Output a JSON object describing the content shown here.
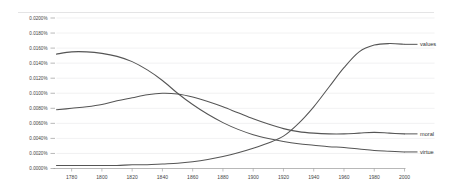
{
  "chart_data": {
    "type": "line",
    "title": "",
    "subtitle": "",
    "xlabel": "",
    "ylabel": "",
    "xlim": [
      1770,
      2000
    ],
    "ylim": [
      0.0,
      0.02
    ],
    "grid": true,
    "legend_position": "right-inline-labels",
    "x_tick_labels": [
      "1780",
      "1800",
      "1820",
      "1840",
      "1860",
      "1880",
      "1900",
      "1920",
      "1940",
      "1960",
      "1980",
      "2000"
    ],
    "x_ticks": [
      1780,
      1800,
      1820,
      1840,
      1860,
      1880,
      1900,
      1920,
      1940,
      1960,
      1980,
      2000
    ],
    "y_tick_labels": [
      "0.0000%",
      "0.0020%",
      "0.0040%",
      "0.0060%",
      "0.0080%",
      "0.0100%",
      "0.0120%",
      "0.0140%",
      "0.0160%",
      "0.0180%",
      "0.0200%"
    ],
    "y_ticks": [
      0.0,
      0.002,
      0.004,
      0.006,
      0.008,
      0.01,
      0.012,
      0.014,
      0.016,
      0.018,
      0.02
    ],
    "y_unit": "%",
    "x": [
      1770,
      1780,
      1790,
      1800,
      1810,
      1820,
      1830,
      1840,
      1850,
      1860,
      1870,
      1880,
      1890,
      1900,
      1910,
      1920,
      1930,
      1940,
      1950,
      1960,
      1970,
      1980,
      1990,
      2000
    ],
    "series": [
      {
        "name": "values",
        "color": "#555555",
        "label_x": 2000,
        "values": [
          0.0004,
          0.0004,
          0.0004,
          0.0004,
          0.0004,
          0.0005,
          0.0005,
          0.0006,
          0.0007,
          0.0009,
          0.0012,
          0.0016,
          0.0021,
          0.0027,
          0.0034,
          0.0043,
          0.006,
          0.0082,
          0.0108,
          0.0134,
          0.0155,
          0.0164,
          0.0166,
          0.0165
        ]
      },
      {
        "name": "moral",
        "color": "#555555",
        "label_x": 2000,
        "values": [
          0.0078,
          0.008,
          0.0082,
          0.0085,
          0.009,
          0.0094,
          0.0098,
          0.01,
          0.0099,
          0.0095,
          0.0089,
          0.0082,
          0.0074,
          0.0066,
          0.0059,
          0.0053,
          0.0049,
          0.0047,
          0.0046,
          0.0046,
          0.0047,
          0.0048,
          0.0047,
          0.0046
        ]
      },
      {
        "name": "virtue",
        "color": "#555555",
        "label_x": 2000,
        "values": [
          0.0152,
          0.0155,
          0.0155,
          0.0153,
          0.0149,
          0.0142,
          0.0131,
          0.0117,
          0.01,
          0.0085,
          0.0072,
          0.0061,
          0.0052,
          0.0045,
          0.004,
          0.0036,
          0.0033,
          0.0031,
          0.0029,
          0.0028,
          0.0026,
          0.0024,
          0.0023,
          0.0022
        ]
      }
    ]
  }
}
